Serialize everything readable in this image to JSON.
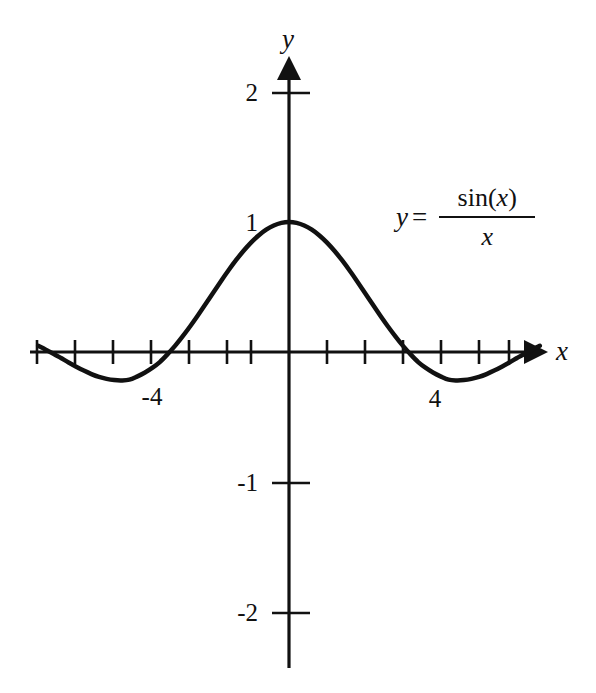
{
  "figure": {
    "background_color": "#ffffff",
    "ink_color": "#111111",
    "width": 596,
    "height": 693
  },
  "equation": {
    "lhs": "y",
    "equals": "=",
    "numerator_fn": "sin",
    "numerator_open": "(",
    "numerator_var": "x",
    "numerator_close": ")",
    "denominator": "x",
    "plain": "y = sin (x) / x"
  },
  "axes": {
    "x_label": "x",
    "y_label": "y",
    "x_tick_labels": [
      "-4",
      "4"
    ],
    "y_tick_labels": [
      "2",
      "1",
      "-1",
      "-2"
    ]
  },
  "chart_data": {
    "type": "line",
    "title": "",
    "subtitle": "",
    "xlabel": "x",
    "ylabel": "y",
    "annotations": [
      "y = sin (x) / x"
    ],
    "grid": false,
    "legend": "none",
    "xlim": [
      -6.8,
      6.6
    ],
    "ylim": [
      -2.3,
      2.2
    ],
    "xticks": [
      -7,
      -6,
      -5,
      -4,
      -3,
      -2,
      -1,
      1,
      2,
      3,
      4,
      5,
      6
    ],
    "xtick_labels": {
      "-4": "-4",
      "4": "4"
    },
    "yticks": [
      -2,
      -1,
      1,
      2
    ],
    "ytick_labels": {
      "2": "2",
      "1": "1",
      "-1": "-1",
      "-2": "-2"
    },
    "series": [
      {
        "name": "y = sin(x)/x",
        "equation": "sin(x)/x",
        "color": "#111111",
        "linewidth": 4.5,
        "x": [
          -6.6,
          -6.4,
          -6.2,
          -6.0,
          -5.8,
          -5.6,
          -5.4,
          -5.2,
          -5.0,
          -4.8,
          -4.6,
          -4.4,
          -4.2,
          -4.0,
          -3.8,
          -3.6,
          -3.4,
          -3.2,
          -3.0,
          -2.8,
          -2.6,
          -2.4,
          -2.2,
          -2.0,
          -1.8,
          -1.6,
          -1.4,
          -1.2,
          -1.0,
          -0.8,
          -0.6,
          -0.4,
          -0.2,
          0.0,
          0.2,
          0.4,
          0.6,
          0.8,
          1.0,
          1.2,
          1.4,
          1.6,
          1.8,
          2.0,
          2.2,
          2.4,
          2.6,
          2.8,
          3.0,
          3.2,
          3.4,
          3.6,
          3.8,
          4.0,
          4.2,
          4.4,
          4.6,
          4.8,
          5.0,
          5.2,
          5.4,
          5.6,
          5.8,
          6.0,
          6.2,
          6.4,
          6.6
        ],
        "y": [
          0.0477,
          0.0182,
          -0.013,
          -0.0466,
          -0.0806,
          -0.113,
          -0.143,
          -0.1697,
          -0.1918,
          -0.2071,
          -0.2162,
          -0.2186,
          -0.2128,
          -0.1892,
          -0.1598,
          -0.1228,
          -0.0776,
          -0.0183,
          0.047,
          0.1199,
          0.1981,
          0.281,
          0.3666,
          0.4546,
          0.541,
          0.6246,
          0.7039,
          0.7767,
          0.8415,
          0.8967,
          0.9411,
          0.9735,
          0.9933,
          1.0,
          0.9933,
          0.9735,
          0.9411,
          0.8967,
          0.8415,
          0.7767,
          0.7039,
          0.6246,
          0.541,
          0.4546,
          0.3666,
          0.281,
          0.1981,
          0.1199,
          0.047,
          -0.0183,
          -0.0776,
          -0.1228,
          -0.1598,
          -0.1892,
          -0.2128,
          -0.2186,
          -0.2162,
          -0.2071,
          -0.1918,
          -0.1697,
          -0.143,
          -0.113,
          -0.0806,
          -0.0466,
          -0.013,
          0.0182,
          0.0477
        ],
        "key_points": {
          "maximum": {
            "x": 0,
            "y": 1.0
          },
          "zeros": [
            -6.283,
            -3.1416,
            3.1416,
            6.283
          ],
          "minima": [
            {
              "x": -4.493,
              "y": -0.2172
            },
            {
              "x": 4.493,
              "y": -0.2172
            }
          ]
        }
      }
    ]
  }
}
